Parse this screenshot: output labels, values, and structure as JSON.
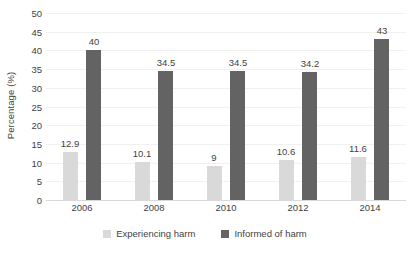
{
  "chart_data": {
    "type": "bar",
    "title": "",
    "xlabel": "",
    "ylabel": "Percentage (%)",
    "categories": [
      "2006",
      "2008",
      "2010",
      "2012",
      "2014"
    ],
    "series": [
      {
        "name": "Experiencing harm",
        "color": "#d9d9d9",
        "values": [
          12.9,
          10.1,
          9,
          10.6,
          11.6
        ],
        "labels": [
          "12.9",
          "10.1",
          "9",
          "10.6",
          "11.6"
        ]
      },
      {
        "name": "Informed of harm",
        "color": "#636363",
        "values": [
          40,
          34.5,
          34.5,
          34.2,
          43
        ],
        "labels": [
          "40",
          "34.5",
          "34.5",
          "34.2",
          "43"
        ]
      }
    ],
    "ylim": [
      0,
      50
    ],
    "ytick_values": [
      0,
      5,
      10,
      15,
      20,
      25,
      30,
      35,
      40,
      45,
      50
    ],
    "ytick_labels": [
      "0",
      "5",
      "10",
      "15",
      "20",
      "25",
      "30",
      "35",
      "40",
      "45",
      "50"
    ],
    "grid": true,
    "legend_position": "bottom",
    "orientation": "vertical",
    "grouped": true
  },
  "colors": {
    "series_a": "#d9d9d9",
    "series_b": "#636363",
    "gridline": "#f0f0f0",
    "axis": "#d9d9d9",
    "text": "#3f3f3f",
    "background": "#ffffff"
  }
}
